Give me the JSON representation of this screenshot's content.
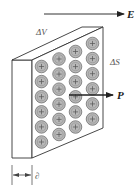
{
  "diagram": {
    "labels": {
      "field": "E",
      "polarization": "P",
      "volume": "ΔV",
      "surface": "ΔS",
      "thickness": "∂"
    },
    "charge_grid": {
      "columns": 4,
      "rows": 6,
      "charge_symbol": "+"
    },
    "colors": {
      "line": "#333333",
      "charge_fill": "#b8b8b8",
      "charge_stroke": "#666666",
      "label": "#555555"
    }
  }
}
